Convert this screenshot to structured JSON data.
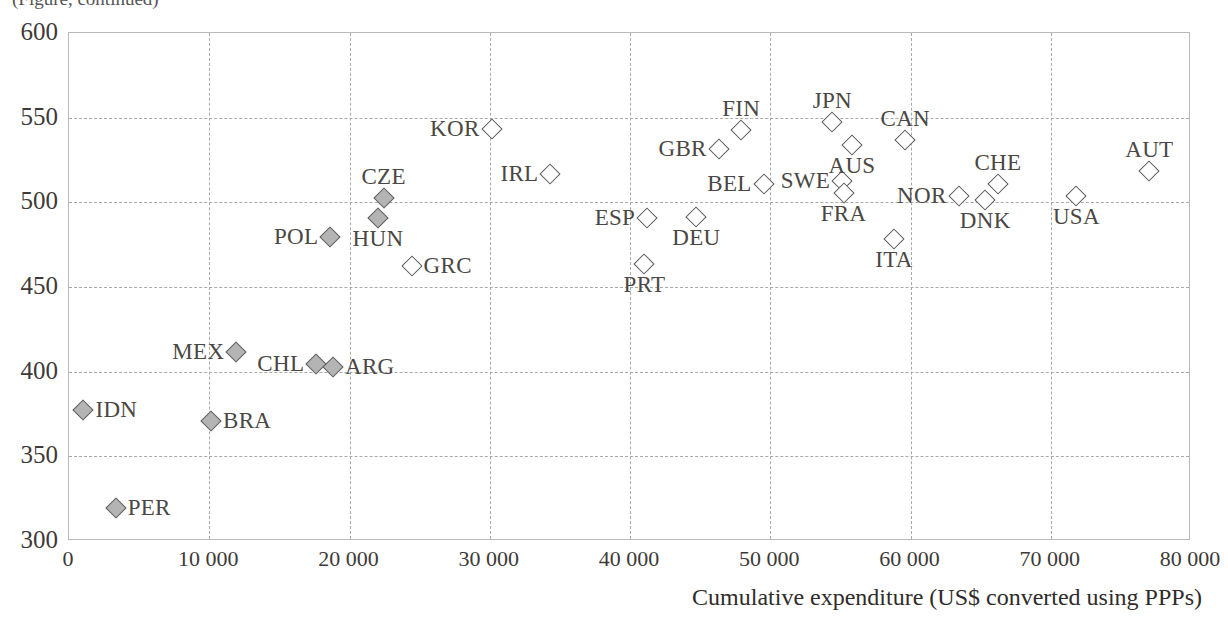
{
  "figure": {
    "cropped_caption_fragment": "(Figure, continued)",
    "background_color": "#ffffff",
    "marker_fill_hollow": "#ffffff",
    "marker_fill_solid": "#b4b4b4",
    "marker_stroke": "#575757",
    "trendline_color": "#1a1a1a",
    "gridline_color": "#a9a9a9"
  },
  "chart_data": {
    "type": "scatter",
    "title": "",
    "xlabel": "Cumulative expenditure (US$ converted using PPPs)",
    "ylabel": "",
    "xlim": [
      0,
      80000
    ],
    "ylim": [
      300,
      600
    ],
    "xticks": [
      0,
      10000,
      20000,
      30000,
      40000,
      50000,
      60000,
      70000,
      80000
    ],
    "xtick_labels": [
      "0",
      "10 000",
      "20 000",
      "30 000",
      "40 000",
      "50 000",
      "60 000",
      "70 000",
      "80 000"
    ],
    "yticks": [
      300,
      350,
      400,
      450,
      500,
      550,
      600
    ],
    "ytick_labels": [
      "300",
      "350",
      "400",
      "450",
      "500",
      "550",
      "600"
    ],
    "grid": "dashed both axes",
    "legend": "none",
    "trendline": {
      "type": "linear",
      "x_start": 1700,
      "y_start": 404,
      "x_end": 77700,
      "y_end": 557
    },
    "points": [
      {
        "label": "IDN",
        "x": 1100,
        "y": 377,
        "fill": "solid",
        "label_side": "right"
      },
      {
        "label": "PER",
        "x": 3400,
        "y": 319,
        "fill": "solid",
        "label_side": "right"
      },
      {
        "label": "BRA",
        "x": 10200,
        "y": 370,
        "fill": "solid",
        "label_side": "right"
      },
      {
        "label": "MEX",
        "x": 12000,
        "y": 411,
        "fill": "solid",
        "label_side": "left"
      },
      {
        "label": "CHL",
        "x": 17700,
        "y": 404,
        "fill": "solid",
        "label_side": "left"
      },
      {
        "label": "ARG",
        "x": 18900,
        "y": 402,
        "fill": "solid",
        "label_side": "right"
      },
      {
        "label": "POL",
        "x": 18700,
        "y": 479,
        "fill": "solid",
        "label_side": "left"
      },
      {
        "label": "HUN",
        "x": 22100,
        "y": 490,
        "fill": "solid",
        "label_side": "below"
      },
      {
        "label": "CZE",
        "x": 22500,
        "y": 502,
        "fill": "solid",
        "label_side": "above"
      },
      {
        "label": "GRC",
        "x": 24500,
        "y": 462,
        "fill": "hollow",
        "label_side": "right"
      },
      {
        "label": "KOR",
        "x": 30200,
        "y": 543,
        "fill": "hollow",
        "label_side": "left"
      },
      {
        "label": "IRL",
        "x": 34400,
        "y": 516,
        "fill": "hollow",
        "label_side": "left"
      },
      {
        "label": "PRT",
        "x": 41100,
        "y": 463,
        "fill": "hollow",
        "label_side": "below"
      },
      {
        "label": "ESP",
        "x": 41300,
        "y": 490,
        "fill": "hollow",
        "label_side": "left"
      },
      {
        "label": "DEU",
        "x": 44800,
        "y": 491,
        "fill": "hollow",
        "label_side": "below"
      },
      {
        "label": "GBR",
        "x": 46400,
        "y": 531,
        "fill": "hollow",
        "label_side": "left"
      },
      {
        "label": "FIN",
        "x": 48000,
        "y": 542,
        "fill": "hollow",
        "label_side": "above"
      },
      {
        "label": "BEL",
        "x": 49600,
        "y": 510,
        "fill": "hollow",
        "label_side": "left"
      },
      {
        "label": "SWE",
        "x": 55200,
        "y": 512,
        "fill": "hollow",
        "label_side": "left"
      },
      {
        "label": "JPN",
        "x": 54500,
        "y": 547,
        "fill": "hollow",
        "label_side": "above"
      },
      {
        "label": "AUS",
        "x": 55900,
        "y": 533,
        "fill": "hollow",
        "label_side": "below"
      },
      {
        "label": "FRA",
        "x": 55300,
        "y": 505,
        "fill": "hollow",
        "label_side": "below"
      },
      {
        "label": "CAN",
        "x": 59700,
        "y": 536,
        "fill": "hollow",
        "label_side": "above"
      },
      {
        "label": "ITA",
        "x": 58900,
        "y": 478,
        "fill": "hollow",
        "label_side": "below"
      },
      {
        "label": "NOR",
        "x": 63500,
        "y": 503,
        "fill": "hollow",
        "label_side": "left"
      },
      {
        "label": "DNK",
        "x": 65400,
        "y": 501,
        "fill": "hollow",
        "label_side": "below"
      },
      {
        "label": "CHE",
        "x": 66300,
        "y": 510,
        "fill": "hollow",
        "label_side": "above"
      },
      {
        "label": "USA",
        "x": 71900,
        "y": 503,
        "fill": "hollow",
        "label_side": "below"
      },
      {
        "label": "AUT",
        "x": 77100,
        "y": 518,
        "fill": "hollow",
        "label_side": "above"
      }
    ]
  }
}
